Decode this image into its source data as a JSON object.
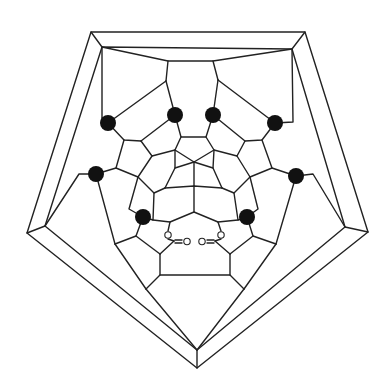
{
  "diagram": {
    "type": "schlegel-diagram",
    "outer_shape": "pentagon",
    "marked_vertex_count": 8,
    "marked_vertex_color": "#111111",
    "line_color": "#222222",
    "background": "#ffffff",
    "labels": {
      "oxygen_left_ring": "O",
      "oxygen_left_double": "O",
      "oxygen_right_ring": "O",
      "oxygen_right_double": "O"
    }
  }
}
